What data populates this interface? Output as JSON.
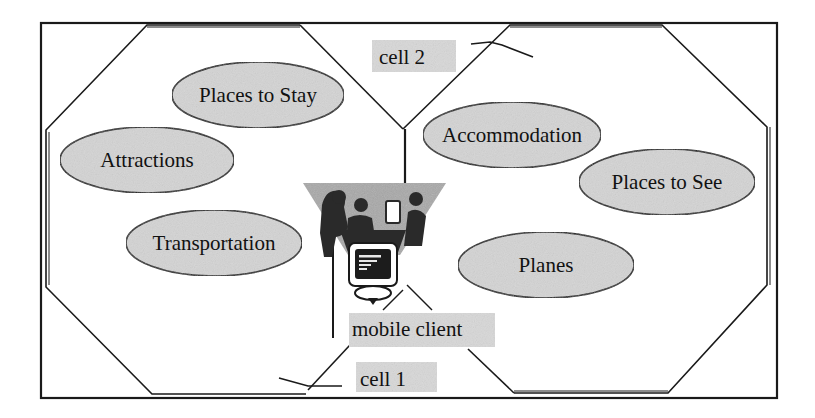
{
  "diagram": {
    "type": "cellular-coverage-diagram",
    "colors": {
      "line": "#1a1a1a",
      "ellipse_fill": "#d4d4d4",
      "label_bg": "#d8d8d8",
      "cone_fill": "#a8a8a8",
      "silhouette": "#2a2a2a",
      "screen": "#1c1c1c"
    },
    "cells": [
      {
        "id": "cell-1",
        "label": "cell 1",
        "side": "left"
      },
      {
        "id": "cell-2",
        "label": "cell 2",
        "side": "right"
      }
    ],
    "services": [
      {
        "label": "Places to Stay",
        "cell": "cell-1",
        "cx": 258,
        "cy": 95,
        "rx": 86,
        "ry": 33
      },
      {
        "label": "Attractions",
        "cell": "cell-1",
        "cx": 147,
        "cy": 160,
        "rx": 87,
        "ry": 33
      },
      {
        "label": "Transportation",
        "cell": "cell-1",
        "cx": 214,
        "cy": 243,
        "rx": 88,
        "ry": 33
      },
      {
        "label": "Accommodation",
        "cell": "cell-2",
        "cx": 512,
        "cy": 135,
        "rx": 89,
        "ry": 33
      },
      {
        "label": "Places to See",
        "cell": "cell-2",
        "cx": 667,
        "cy": 182,
        "rx": 88,
        "ry": 33
      },
      {
        "label": "Planes",
        "cell": "cell-2",
        "cx": 546,
        "cy": 265,
        "rx": 88,
        "ry": 33
      }
    ],
    "client": {
      "label": "mobile client",
      "icon": "people-at-computer-icon"
    }
  }
}
